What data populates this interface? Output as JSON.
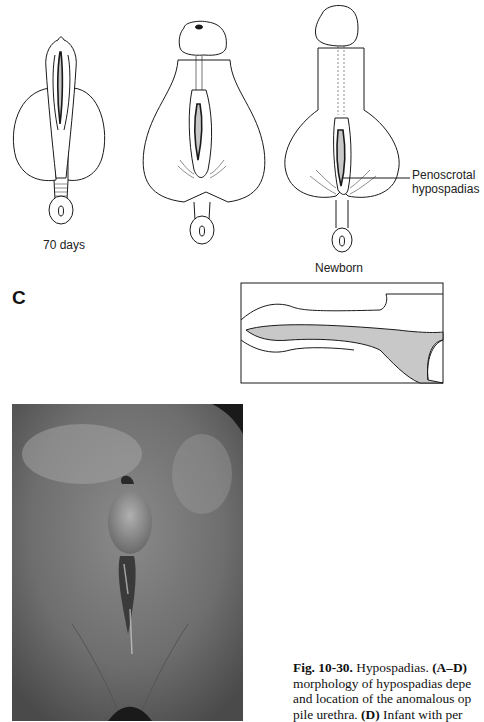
{
  "figure": {
    "panels": [
      {
        "id": "stage-70-days",
        "label": "70 days"
      },
      {
        "id": "stage-intermediate",
        "label": ""
      },
      {
        "id": "stage-newborn",
        "label": "Newborn",
        "annotation": [
          "Penoscrotal",
          "hypospadias"
        ]
      }
    ],
    "panel_c_letter": "C",
    "photo_panel": {
      "description": "Infant with penoscrotal hypospadias (photograph)"
    }
  },
  "caption": {
    "lines": [
      {
        "bold": "Fig. 10-30.",
        "text": " Hypospadias. ",
        "bold2": "(A–D)"
      },
      {
        "text": "morphology of hypospadias depe"
      },
      {
        "text": "and location of the anomalous op"
      },
      {
        "text": "pile urethra. ",
        "bold": "(D)",
        "text2": " Infant with per"
      }
    ]
  },
  "colors": {
    "line": "#1a1a1a",
    "shade": "#c8c8c8",
    "paper": "#ffffff"
  }
}
